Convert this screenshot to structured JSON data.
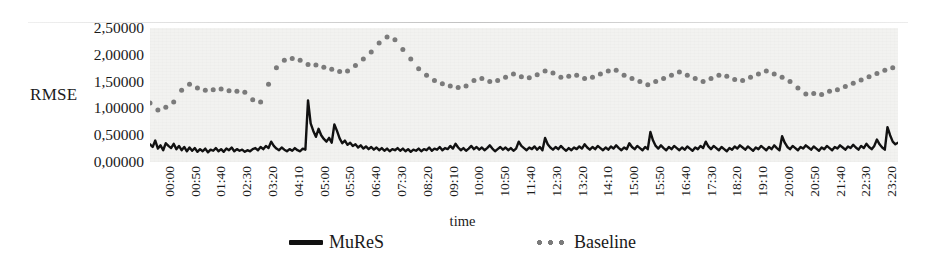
{
  "chart_data": {
    "type": "line",
    "title": "",
    "xlabel": "time",
    "ylabel": "RMSE",
    "ylim": [
      0.0,
      2.5
    ],
    "yticks": [
      0.0,
      0.5,
      1.0,
      1.5,
      2.0,
      2.5
    ],
    "ytick_labels": [
      "0,00000",
      "0,50000",
      "1,00000",
      "1,50000",
      "2,00000",
      "2,50000"
    ],
    "grid": false,
    "legend_position": "bottom",
    "decimal_separator": ",",
    "x_tick_labels": [
      "00:00",
      "00:50",
      "01:40",
      "02:30",
      "03:20",
      "04:10",
      "05:00",
      "05:50",
      "06:40",
      "07:30",
      "08:20",
      "09:10",
      "10:00",
      "10:50",
      "11:40",
      "12:30",
      "13:20",
      "14:10",
      "15:00",
      "15:50",
      "16:40",
      "17:30",
      "18:20",
      "19:10",
      "20:00",
      "20:50",
      "21:40",
      "22:30",
      "23:20"
    ],
    "x_tick_step_minutes": 50,
    "x_range": [
      "00:00",
      "23:59"
    ],
    "series": [
      {
        "name": "MuReS",
        "style": "solid",
        "color": "#111111",
        "values": [
          0.33,
          0.28,
          0.4,
          0.25,
          0.31,
          0.22,
          0.35,
          0.3,
          0.26,
          0.34,
          0.24,
          0.3,
          0.22,
          0.28,
          0.2,
          0.27,
          0.21,
          0.26,
          0.19,
          0.24,
          0.2,
          0.25,
          0.18,
          0.23,
          0.21,
          0.26,
          0.2,
          0.24,
          0.19,
          0.25,
          0.22,
          0.27,
          0.2,
          0.24,
          0.21,
          0.23,
          0.19,
          0.22,
          0.2,
          0.24,
          0.26,
          0.22,
          0.28,
          0.24,
          0.3,
          0.26,
          0.38,
          0.3,
          0.25,
          0.22,
          0.27,
          0.23,
          0.2,
          0.24,
          0.21,
          0.26,
          0.22,
          0.2,
          0.25,
          0.23,
          1.15,
          0.72,
          0.58,
          0.47,
          0.62,
          0.5,
          0.43,
          0.38,
          0.45,
          0.36,
          0.7,
          0.58,
          0.44,
          0.35,
          0.4,
          0.32,
          0.36,
          0.3,
          0.33,
          0.27,
          0.31,
          0.25,
          0.29,
          0.24,
          0.28,
          0.23,
          0.27,
          0.22,
          0.26,
          0.21,
          0.25,
          0.2,
          0.24,
          0.22,
          0.26,
          0.21,
          0.25,
          0.2,
          0.24,
          0.19,
          0.23,
          0.21,
          0.25,
          0.2,
          0.24,
          0.22,
          0.27,
          0.21,
          0.25,
          0.23,
          0.28,
          0.22,
          0.26,
          0.24,
          0.3,
          0.25,
          0.34,
          0.27,
          0.22,
          0.26,
          0.21,
          0.25,
          0.3,
          0.24,
          0.28,
          0.23,
          0.27,
          0.22,
          0.26,
          0.31,
          0.25,
          0.2,
          0.24,
          0.28,
          0.23,
          0.27,
          0.22,
          0.26,
          0.21,
          0.25,
          0.38,
          0.3,
          0.26,
          0.22,
          0.27,
          0.24,
          0.29,
          0.23,
          0.28,
          0.22,
          0.45,
          0.33,
          0.27,
          0.23,
          0.28,
          0.24,
          0.3,
          0.25,
          0.21,
          0.26,
          0.22,
          0.27,
          0.24,
          0.29,
          0.25,
          0.33,
          0.27,
          0.23,
          0.28,
          0.24,
          0.3,
          0.26,
          0.22,
          0.27,
          0.23,
          0.29,
          0.25,
          0.31,
          0.26,
          0.22,
          0.27,
          0.24,
          0.35,
          0.28,
          0.24,
          0.3,
          0.26,
          0.22,
          0.28,
          0.24,
          0.56,
          0.4,
          0.3,
          0.25,
          0.31,
          0.26,
          0.22,
          0.28,
          0.24,
          0.3,
          0.26,
          0.22,
          0.27,
          0.23,
          0.29,
          0.25,
          0.21,
          0.27,
          0.24,
          0.3,
          0.26,
          0.38,
          0.29,
          0.24,
          0.3,
          0.26,
          0.22,
          0.28,
          0.24,
          0.2,
          0.26,
          0.23,
          0.29,
          0.25,
          0.31,
          0.27,
          0.23,
          0.29,
          0.25,
          0.21,
          0.27,
          0.24,
          0.3,
          0.26,
          0.22,
          0.28,
          0.24,
          0.31,
          0.26,
          0.22,
          0.48,
          0.36,
          0.28,
          0.24,
          0.3,
          0.26,
          0.22,
          0.28,
          0.25,
          0.31,
          0.27,
          0.23,
          0.29,
          0.25,
          0.21,
          0.27,
          0.24,
          0.3,
          0.26,
          0.22,
          0.28,
          0.25,
          0.31,
          0.27,
          0.23,
          0.29,
          0.26,
          0.32,
          0.27,
          0.23,
          0.3,
          0.26,
          0.34,
          0.28,
          0.24,
          0.3,
          0.42,
          0.33,
          0.27,
          0.23,
          0.65,
          0.5,
          0.38,
          0.33,
          0.36
        ]
      },
      {
        "name": "Baseline",
        "style": "dotted",
        "color": "#7b7b7b",
        "values": [
          1.1,
          1.02,
          0.95,
          0.97,
          1.0,
          0.98,
          1.02,
          1.05,
          1.08,
          1.12,
          1.18,
          1.25,
          1.34,
          1.42,
          1.48,
          1.45,
          1.4,
          1.36,
          1.38,
          1.35,
          1.37,
          1.34,
          1.36,
          1.33,
          1.35,
          1.37,
          1.34,
          1.36,
          1.38,
          1.35,
          1.33,
          1.36,
          1.34,
          1.32,
          1.35,
          1.33,
          1.3,
          1.27,
          1.22,
          1.16,
          1.1,
          1.08,
          1.12,
          1.2,
          1.32,
          1.45,
          1.58,
          1.68,
          1.76,
          1.82,
          1.86,
          1.9,
          1.92,
          1.89,
          1.93,
          1.9,
          1.87,
          1.9,
          1.88,
          1.85,
          1.82,
          1.8,
          1.84,
          1.81,
          1.78,
          1.8,
          1.77,
          1.74,
          1.76,
          1.73,
          1.7,
          1.72,
          1.69,
          1.66,
          1.68,
          1.7,
          1.73,
          1.76,
          1.8,
          1.84,
          1.88,
          1.92,
          1.96,
          2.0,
          2.05,
          2.1,
          2.16,
          2.22,
          2.27,
          2.3,
          2.33,
          2.35,
          2.32,
          2.28,
          2.22,
          2.16,
          2.1,
          2.04,
          1.98,
          1.92,
          1.86,
          1.8,
          1.74,
          1.7,
          1.66,
          1.62,
          1.58,
          1.55,
          1.52,
          1.5,
          1.48,
          1.46,
          1.44,
          1.43,
          1.42,
          1.41,
          1.4,
          1.39,
          1.38,
          1.4,
          1.42,
          1.45,
          1.48,
          1.52,
          1.55,
          1.57,
          1.56,
          1.54,
          1.52,
          1.5,
          1.48,
          1.5,
          1.52,
          1.54,
          1.56,
          1.58,
          1.6,
          1.62,
          1.64,
          1.63,
          1.61,
          1.59,
          1.57,
          1.55,
          1.57,
          1.59,
          1.61,
          1.63,
          1.65,
          1.67,
          1.7,
          1.72,
          1.69,
          1.66,
          1.63,
          1.6,
          1.58,
          1.56,
          1.58,
          1.6,
          1.62,
          1.64,
          1.62,
          1.6,
          1.58,
          1.56,
          1.54,
          1.56,
          1.58,
          1.6,
          1.62,
          1.64,
          1.66,
          1.68,
          1.7,
          1.72,
          1.74,
          1.71,
          1.68,
          1.65,
          1.62,
          1.6,
          1.58,
          1.56,
          1.54,
          1.52,
          1.5,
          1.48,
          1.46,
          1.44,
          1.46,
          1.48,
          1.5,
          1.52,
          1.54,
          1.56,
          1.58,
          1.6,
          1.62,
          1.64,
          1.66,
          1.68,
          1.66,
          1.64,
          1.62,
          1.6,
          1.58,
          1.56,
          1.54,
          1.52,
          1.5,
          1.52,
          1.54,
          1.56,
          1.58,
          1.6,
          1.62,
          1.64,
          1.62,
          1.6,
          1.58,
          1.56,
          1.54,
          1.52,
          1.5,
          1.52,
          1.54,
          1.56,
          1.58,
          1.6,
          1.62,
          1.64,
          1.66,
          1.68,
          1.7,
          1.68,
          1.66,
          1.64,
          1.62,
          1.6,
          1.58,
          1.56,
          1.54,
          1.5,
          1.46,
          1.42,
          1.38,
          1.34,
          1.3,
          1.27,
          1.25,
          1.26,
          1.28,
          1.3,
          1.28,
          1.26,
          1.28,
          1.3,
          1.32,
          1.34,
          1.33,
          1.35,
          1.37,
          1.39,
          1.41,
          1.43,
          1.45,
          1.47,
          1.49,
          1.51,
          1.53,
          1.55,
          1.57,
          1.59,
          1.61,
          1.63,
          1.65,
          1.67,
          1.69,
          1.71,
          1.73,
          1.75,
          1.76,
          1.74,
          1.72
        ]
      }
    ]
  },
  "legend": {
    "entries": [
      {
        "label": "MuReS",
        "marker": "solid-line-swatch"
      },
      {
        "label": "Baseline",
        "marker": "dotted-line-swatch"
      }
    ]
  }
}
